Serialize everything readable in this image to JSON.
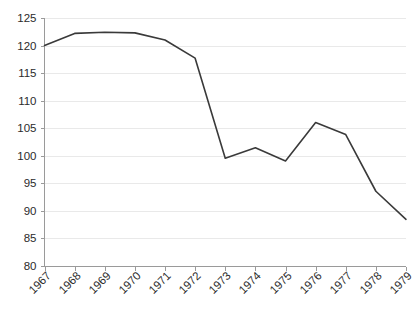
{
  "chart_data": {
    "type": "line",
    "title": "",
    "subtitle": "",
    "xlabel": "",
    "ylabel": "",
    "categories": [
      "1967",
      "1968",
      "1969",
      "1970",
      "1971",
      "1972",
      "1973",
      "1974",
      "1975",
      "1976",
      "1977",
      "1978",
      "1979"
    ],
    "values": [
      120.0,
      122.2,
      122.4,
      122.3,
      121.0,
      117.7,
      99.5,
      101.4,
      99.0,
      106.0,
      103.8,
      93.5,
      88.4
    ],
    "series": [
      {
        "name": "series-1",
        "color": "#3a3a3a",
        "values": [
          120.0,
          122.2,
          122.4,
          122.3,
          121.0,
          117.7,
          99.5,
          101.4,
          99.0,
          106.0,
          103.8,
          93.5,
          88.4
        ]
      }
    ],
    "ylim": [
      80,
      125
    ],
    "yticks": [
      80,
      85,
      90,
      95,
      100,
      105,
      110,
      115,
      120,
      125
    ],
    "ytick_labels": [
      "80",
      "85",
      "90",
      "95",
      "100",
      "105",
      "110",
      "115",
      "120",
      "125"
    ],
    "xtick_labels": [
      "1967",
      "1968",
      "1969",
      "1970",
      "1971",
      "1972",
      "1973",
      "1974",
      "1975",
      "1976",
      "1977",
      "1978",
      "1979"
    ],
    "xtick_label_rotation": -45,
    "grid": true,
    "grid_axis": "y",
    "grid_color": "#e9e9e9",
    "axis_color": "#9a9a9a",
    "legend": false,
    "legend_position": "none",
    "background_color": "#ffffff",
    "markers": false
  }
}
